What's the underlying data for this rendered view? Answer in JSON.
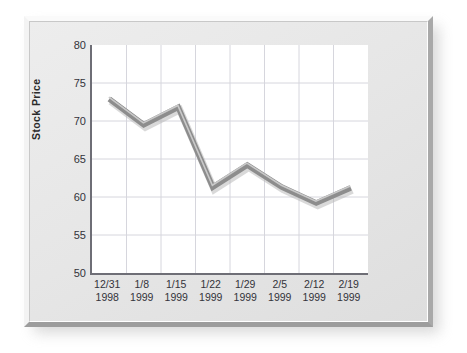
{
  "chart_data": {
    "type": "line",
    "title": "",
    "xlabel": "",
    "ylabel": "Stock Price",
    "ylim": [
      50,
      80
    ],
    "ytick_step": 5,
    "yticks": [
      80,
      75,
      70,
      65,
      60,
      55,
      50
    ],
    "grid": true,
    "legend": "none",
    "categories": [
      "12/31\n1998",
      "1/8\n1999",
      "1/15\n1999",
      "1/22\n1999",
      "1/29\n1999",
      "2/5\n1999",
      "2/12\n1999",
      "2/19\n1999"
    ],
    "category_parts": [
      {
        "date": "12/31",
        "year": "1998"
      },
      {
        "date": "1/8",
        "year": "1999"
      },
      {
        "date": "1/15",
        "year": "1999"
      },
      {
        "date": "1/22",
        "year": "1999"
      },
      {
        "date": "1/29",
        "year": "1999"
      },
      {
        "date": "2/5",
        "year": "1999"
      },
      {
        "date": "2/12",
        "year": "1999"
      },
      {
        "date": "2/19",
        "year": "1999"
      }
    ],
    "values": [
      72.9,
      69.5,
      71.8,
      61.3,
      64.2,
      61.3,
      59.2,
      61.2
    ],
    "series": [
      {
        "name": "Stock Price",
        "values": [
          72.9,
          69.5,
          71.8,
          61.3,
          64.2,
          61.3,
          59.2,
          61.2
        ]
      }
    ],
    "colors": {
      "line": "#8d8d8d",
      "line_highlight": "#c9c9c9",
      "grid": "#d6d6dd",
      "axis": "#6e6e76",
      "plot_background": "#ffffff",
      "frame": "#e6e6e6",
      "text": "#33333a"
    }
  }
}
